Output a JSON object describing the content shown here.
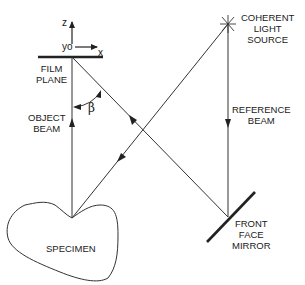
{
  "diagram": {
    "type": "holography-setup",
    "axes": {
      "z_label": "z",
      "y_label": "yo",
      "x_label": "x"
    },
    "labels": {
      "film_plane": [
        "FILM",
        "PLANE"
      ],
      "object_beam": [
        "OBJECT",
        "BEAM"
      ],
      "coherent_light_source": [
        "COHERENT",
        "LIGHT",
        "SOURCE"
      ],
      "reference_beam": [
        "REFERENCE",
        "BEAM"
      ],
      "front_face_mirror": [
        "FRONT",
        "FACE",
        "MIRROR"
      ],
      "specimen": "SPECIMEN",
      "angle": "β"
    },
    "colors": {
      "line": "#333333",
      "text": "#1a1a1a",
      "background": "#ffffff"
    }
  }
}
